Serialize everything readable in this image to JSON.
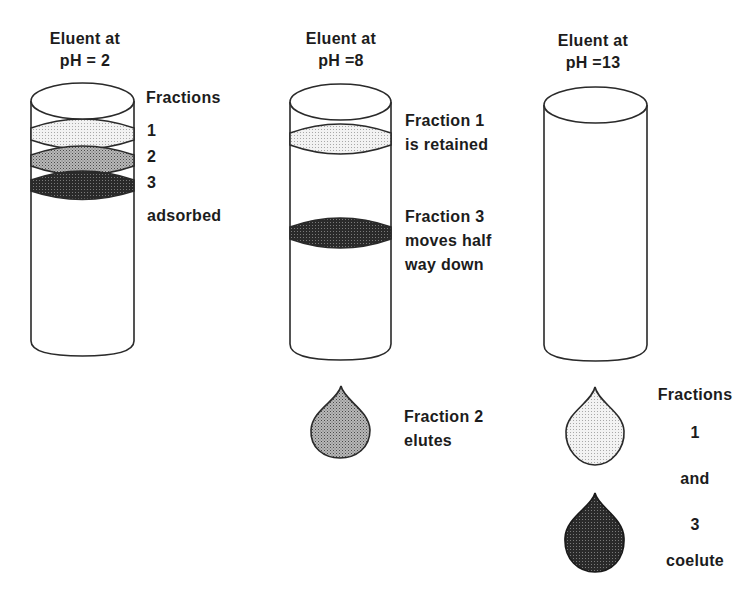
{
  "columns": [
    {
      "header_line1": "Eluent at",
      "header_line2": "pH = 2",
      "bands": [
        {
          "fraction": "1",
          "shade": "light"
        },
        {
          "fraction": "2",
          "shade": "medium"
        },
        {
          "fraction": "3",
          "shade": "dark"
        }
      ],
      "side_labels": [
        "Fractions",
        "1",
        "2",
        "3",
        "adsorbed"
      ]
    },
    {
      "header_line1": "Eluent at",
      "header_line2": "pH =8",
      "bands": [
        {
          "fraction": "1",
          "shade": "light"
        },
        {
          "fraction": "3",
          "shade": "dark"
        }
      ],
      "side_labels": [
        "Fraction 1",
        "is retained",
        "Fraction 3",
        "moves half",
        "way down"
      ],
      "drops": [
        {
          "fraction": "2",
          "shade": "medium"
        }
      ],
      "drop_labels": [
        "Fraction 2",
        "elutes"
      ]
    },
    {
      "header_line1": "Eluent at",
      "header_line2": "pH =13",
      "bands": [],
      "drops": [
        {
          "fraction": "1",
          "shade": "light"
        },
        {
          "fraction": "3",
          "shade": "dark"
        }
      ],
      "drop_labels": [
        "Fractions",
        "1",
        "and",
        "3",
        "coelute"
      ]
    }
  ],
  "colors": {
    "stroke": "#2a2a2a",
    "light": "#e6e6e6",
    "medium": "#9a9a9a",
    "dark": "#2e2e2e"
  }
}
